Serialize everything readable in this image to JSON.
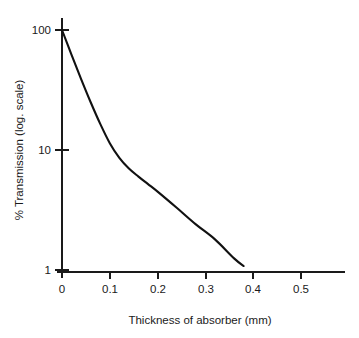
{
  "chart_data": {
    "type": "line",
    "title": "",
    "xlabel": "Thickness of absorber (mm)",
    "ylabel": "% Transmission (log. scale)",
    "yscale": "log",
    "xscale": "linear",
    "xlim": [
      0,
      0.6
    ],
    "ylim": [
      1,
      100
    ],
    "grid": false,
    "legend": false,
    "x_ticks": [
      {
        "value": 0,
        "label": "0"
      },
      {
        "value": 0.1,
        "label": "0.1"
      },
      {
        "value": 0.2,
        "label": "0.2"
      },
      {
        "value": 0.3,
        "label": "0.3"
      },
      {
        "value": 0.4,
        "label": "0.4"
      },
      {
        "value": 0.5,
        "label": "0.5"
      }
    ],
    "y_ticks": [
      {
        "value": 100,
        "label": "100"
      },
      {
        "value": 10,
        "label": "10"
      },
      {
        "value": 1,
        "label": "1"
      }
    ],
    "series": [
      {
        "name": "transmission",
        "x": [
          0.0,
          0.02,
          0.04,
          0.06,
          0.08,
          0.1,
          0.12,
          0.14,
          0.16,
          0.18,
          0.2,
          0.24,
          0.28,
          0.32,
          0.36,
          0.38
        ],
        "y": [
          100.0,
          62.0,
          39.0,
          25.0,
          16.5,
          11.4,
          8.6,
          7.0,
          6.0,
          5.2,
          4.5,
          3.3,
          2.4,
          1.8,
          1.25,
          1.08
        ]
      }
    ],
    "annotations": []
  },
  "figure": {
    "xaxis_title": "Thickness of absorber (mm)",
    "yaxis_title": "% Transmission (log. scale)",
    "y_tick_labels": [
      "100",
      "10",
      "1"
    ],
    "x_tick_labels": [
      "0",
      "0.1",
      "0.2",
      "0.3",
      "0.4",
      "0.5"
    ],
    "curve_color": "#111111",
    "axis_color": "#1a1a1a",
    "background_color": "#ffffff"
  }
}
